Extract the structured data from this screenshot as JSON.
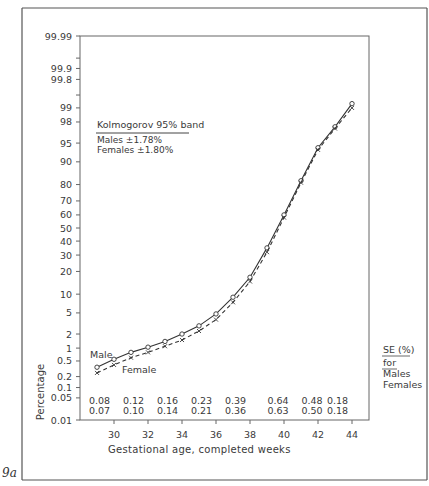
{
  "figure": {
    "label": "9a"
  },
  "chart_data": {
    "type": "line",
    "title": "",
    "xlabel": "Gestational age, completed weeks",
    "ylabel": "Percentage",
    "y_scale": "probability (normal probit)",
    "x_ticks": [
      30,
      32,
      34,
      36,
      38,
      40,
      42,
      44
    ],
    "y_ticks": [
      "0.01",
      "0.05",
      "0.1",
      "0.2",
      "0.5",
      "1",
      "2",
      "5",
      "10",
      "20",
      "30",
      "40",
      "50",
      "60",
      "70",
      "80",
      "90",
      "95",
      "98",
      "99",
      "99.8",
      "99.9",
      "99.99"
    ],
    "xlim": [
      28,
      45
    ],
    "ylim": [
      0.01,
      99.99
    ],
    "grid": false,
    "series": [
      {
        "name": "Male",
        "style": "solid line, open circle markers",
        "x": [
          29,
          30,
          31,
          32,
          33,
          34,
          35,
          36,
          37,
          38,
          39,
          40,
          41,
          42,
          43,
          44
        ],
        "values": [
          0.35,
          0.55,
          0.8,
          1.05,
          1.4,
          2.0,
          2.9,
          4.8,
          9.0,
          17,
          35,
          60,
          82,
          94,
          97.5,
          99.2
        ]
      },
      {
        "name": "Female",
        "style": "dashed line, x markers",
        "x": [
          29,
          30,
          31,
          32,
          33,
          34,
          35,
          36,
          37,
          38,
          39,
          40,
          41,
          42,
          43,
          44
        ],
        "values": [
          0.25,
          0.4,
          0.6,
          0.8,
          1.1,
          1.5,
          2.3,
          3.8,
          7.5,
          15,
          32,
          58,
          81,
          93.5,
          97.3,
          99.0
        ]
      }
    ],
    "annotations": {
      "kolmogorov_title": "Kolmogorov 95% band",
      "males_band": "Males    ±1.78%",
      "females_band": "Females ±1.80%",
      "male_label": "Male",
      "female_label": "Female",
      "se_title": "SE (%)",
      "se_for": "for",
      "se_males": "Males",
      "se_females": "Females"
    },
    "se_table": {
      "x": [
        29,
        31,
        33,
        35,
        37,
        39.5,
        41.5,
        43
      ],
      "males": [
        "0.08",
        "0.12",
        "0.16",
        "0.23",
        "0.39",
        "0.64",
        "0.48",
        "0.18"
      ],
      "females": [
        "0.07",
        "0.10",
        "0.14",
        "0.21",
        "0.36",
        "0.63",
        "0.50",
        "0.18"
      ]
    }
  }
}
